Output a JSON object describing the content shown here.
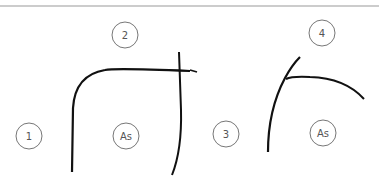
{
  "diagram": {
    "labels": {
      "one": "1",
      "two": "2",
      "three": "3",
      "four": "4",
      "as_left": "As",
      "as_right": "As"
    },
    "colors": {
      "stroke": "#111111",
      "circle": "#777777",
      "rule": "#999999"
    }
  }
}
